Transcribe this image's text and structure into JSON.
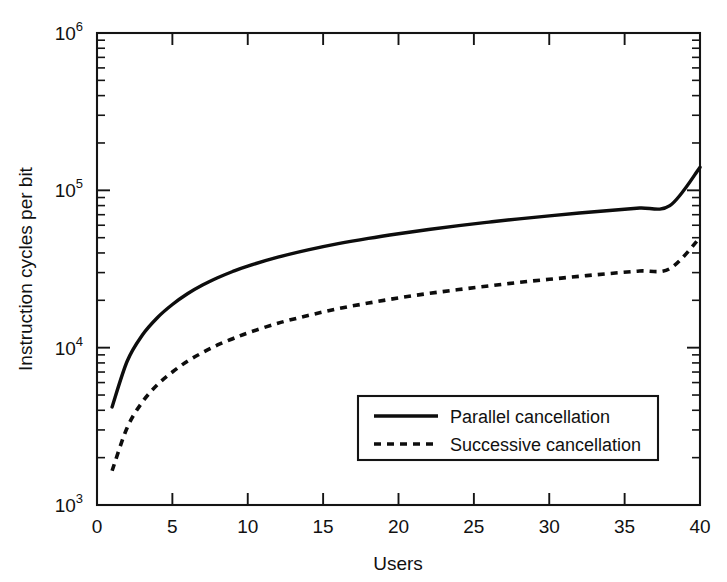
{
  "chart_data": {
    "type": "line",
    "title": "",
    "xlabel": "Users",
    "ylabel": "Instruction cycles per bit",
    "xlim": [
      0,
      40
    ],
    "ylim": [
      1000,
      1000000
    ],
    "yscale": "log",
    "xscale": "linear",
    "grid": false,
    "legend_position": "lower right",
    "x_ticks": [
      "0",
      "5",
      "10",
      "15",
      "20",
      "25",
      "30",
      "35",
      "40"
    ],
    "x_tick_values": [
      0,
      5,
      10,
      15,
      20,
      25,
      30,
      35,
      40
    ],
    "y_ticks": [
      {
        "mantissa": "10",
        "exponent": "3",
        "value": 1000
      },
      {
        "mantissa": "10",
        "exponent": "4",
        "value": 10000
      },
      {
        "mantissa": "10",
        "exponent": "5",
        "value": 100000
      },
      {
        "mantissa": "10",
        "exponent": "6",
        "value": 1000000
      }
    ],
    "x": [
      1,
      2,
      3,
      4,
      5,
      6,
      7,
      8,
      9,
      10,
      12,
      14,
      16,
      18,
      20,
      22,
      24,
      26,
      28,
      30,
      32,
      34,
      36,
      38,
      40
    ],
    "series": [
      {
        "name": "Parallel cancellation",
        "style": "solid",
        "color": "#0d0d0d",
        "values": [
          4200,
          8200,
          12000,
          15500,
          18800,
          22000,
          25000,
          27800,
          30500,
          33000,
          37600,
          41800,
          45800,
          49500,
          53000,
          56400,
          59700,
          62800,
          65900,
          68800,
          71700,
          74500,
          77200,
          79900,
          140000
        ]
      },
      {
        "name": "Successive cancellation",
        "style": "dashed",
        "color": "#0d0d0d",
        "values": [
          1650,
          3100,
          4500,
          5800,
          7000,
          8200,
          9300,
          10400,
          11400,
          12400,
          14300,
          16000,
          17700,
          19200,
          20700,
          22100,
          23400,
          24700,
          26000,
          27200,
          28400,
          29600,
          30700,
          31800,
          50000
        ]
      }
    ],
    "legend_entries": [
      {
        "label": "Parallel cancellation",
        "style": "solid"
      },
      {
        "label": "Successive cancellation",
        "style": "dashed"
      }
    ]
  }
}
